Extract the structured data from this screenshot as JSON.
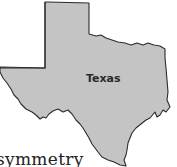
{
  "map": {
    "region_label": "Texas",
    "fill_color": "#c4c4c4",
    "stroke_color": "#2b2b2b"
  },
  "caption": {
    "text": "symmetry"
  }
}
